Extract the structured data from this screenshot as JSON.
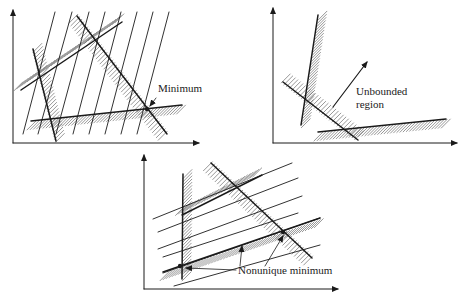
{
  "figure": {
    "panels": [
      {
        "id": "unique-minimum",
        "axes": {
          "origin": [
            13,
            143
          ],
          "y_top": 10,
          "x_right": 199
        },
        "constraints": [
          {
            "from": [
              33,
              49
            ],
            "to": [
              56,
              141
            ],
            "hatch_side": -1
          },
          {
            "from": [
              21,
              90
            ],
            "to": [
              122,
              22
            ],
            "hatch_side": -1
          },
          {
            "from": [
              77,
              16
            ],
            "to": [
              167,
              134
            ],
            "hatch_side": 1
          },
          {
            "from": [
              31,
              121
            ],
            "to": [
              182,
              105
            ],
            "hatch_side": 1
          }
        ],
        "objective_lines": [
          {
            "from": [
              23,
              134
            ],
            "to": [
              55,
              12
            ]
          },
          {
            "from": [
              38,
              134
            ],
            "to": [
              72,
              12
            ]
          },
          {
            "from": [
              56,
              134
            ],
            "to": [
              89,
              12
            ]
          },
          {
            "from": [
              73,
              134
            ],
            "to": [
              105,
              12
            ]
          },
          {
            "from": [
              89,
              134
            ],
            "to": [
              121,
              12
            ]
          },
          {
            "from": [
              105,
              134
            ],
            "to": [
              137,
              12
            ]
          },
          {
            "from": [
              121,
              134
            ],
            "to": [
              153,
              12
            ]
          },
          {
            "from": [
              137,
              134
            ],
            "to": [
              169,
              12
            ]
          }
        ],
        "points": [
          [
            147,
            109
          ]
        ],
        "labels": [
          {
            "text": "Minimum",
            "x": 158,
            "y": 92
          }
        ],
        "pointer": {
          "from": [
            156,
            98
          ],
          "to": [
            150,
            106
          ]
        }
      },
      {
        "id": "unbounded",
        "axes": {
          "origin": [
            273,
            143
          ],
          "y_top": 8,
          "x_right": 457
        },
        "constraints": [
          {
            "from": [
              318,
              15
            ],
            "to": [
              301,
              125
            ],
            "hatch_side": -1
          },
          {
            "from": [
              283,
              82
            ],
            "to": [
              358,
              140
            ],
            "hatch_side": -1
          },
          {
            "from": [
              318,
              132
            ],
            "to": [
              446,
              119
            ],
            "hatch_side": 1
          }
        ],
        "objective_lines": [],
        "points": [],
        "labels": [
          {
            "text": "Unbounded",
            "x": 356,
            "y": 95
          },
          {
            "text": "region",
            "x": 356,
            "y": 108
          }
        ],
        "arrow": {
          "from": [
            333,
            107
          ],
          "to": [
            367,
            62
          ]
        }
      },
      {
        "id": "nonunique-minimum",
        "axes": {
          "origin": [
            144,
            289
          ],
          "y_top": 155,
          "x_right": 338
        },
        "constraints": [
          {
            "from": [
              183,
              174
            ],
            "to": [
              182,
              279
            ],
            "hatch_side": -1
          },
          {
            "from": [
              182,
              215
            ],
            "to": [
              262,
              175
            ],
            "hatch_side": -1
          },
          {
            "from": [
              211,
              163
            ],
            "to": [
              312,
              258
            ],
            "hatch_side": 1
          },
          {
            "from": [
              163,
              272
            ],
            "to": [
              320,
              218
            ],
            "hatch_side": 1
          }
        ],
        "objective_lines": [
          {
            "from": [
              153,
              219
            ],
            "to": [
              292,
              163
            ]
          },
          {
            "from": [
              158,
              232
            ],
            "to": [
              298,
              178
            ]
          },
          {
            "from": [
              158,
              249
            ],
            "to": [
              302,
              196
            ]
          },
          {
            "from": [
              163,
              257
            ],
            "to": [
              298,
              213
            ]
          },
          {
            "from": [
              163,
              273
            ],
            "to": [
              320,
              218
            ]
          },
          {
            "from": [
              174,
              286
            ],
            "to": [
              320,
              245
            ]
          }
        ],
        "points": [
          [
            180,
            266
          ],
          [
            283,
            232
          ]
        ],
        "labels": [
          {
            "text": "Nonunique minimum",
            "x": 238,
            "y": 274
          }
        ],
        "pointers": [
          {
            "from": [
              236,
              270
            ],
            "to": [
              186,
              268
            ]
          },
          {
            "from": [
              240,
              266
            ],
            "to": [
              242,
              246
            ]
          },
          {
            "from": [
              265,
              266
            ],
            "to": [
              283,
              236
            ]
          }
        ]
      }
    ]
  },
  "colors": {
    "ink": "#1a1a1a",
    "hatch": "#6a6a6a",
    "background": "#ffffff"
  }
}
